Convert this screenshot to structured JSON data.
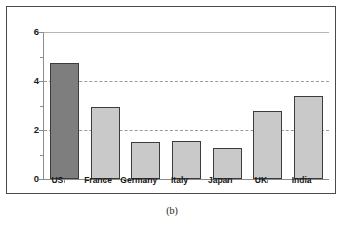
{
  "caption": "(b)",
  "chart_data": {
    "type": "bar",
    "title": "",
    "xlabel": "",
    "ylabel": "",
    "categories": [
      "US",
      "France",
      "Germany",
      "Italy",
      "Japan",
      "UK",
      "India"
    ],
    "values": [
      4.75,
      2.93,
      1.53,
      1.57,
      1.28,
      2.77,
      3.4
    ],
    "ylim": [
      0,
      6
    ],
    "y_ticks": [
      0,
      2,
      4,
      6
    ],
    "y_tick_labels": [
      "0",
      "2",
      "4",
      "6"
    ],
    "y_minor_ticks": [
      1,
      3,
      5
    ],
    "grid": true,
    "gridlines": [
      2,
      4,
      6
    ],
    "legend": null,
    "highlight_index": 0,
    "colors": {
      "bar_fill": "#c9c9c9",
      "bar_highlight_fill": "#7e7e7e",
      "bar_edge": "#3c3c3c",
      "axis": "#8c8c8c",
      "grid": "#9a9a9a",
      "frame": "#4a4a4a",
      "text": "#1a1a1a",
      "background": "#ffffff"
    }
  }
}
